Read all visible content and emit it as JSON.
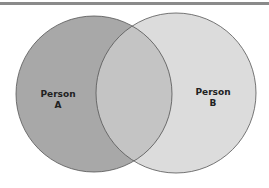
{
  "diagram": {
    "type": "venn",
    "sets": [
      {
        "id": "A",
        "label_line1": "Person",
        "label_line2": "A",
        "fill": "#a8a8a8"
      },
      {
        "id": "B",
        "label_line1": "Person",
        "label_line2": "B",
        "fill": "#dcdcdc"
      }
    ],
    "overlap_fill": "#c4c4c4",
    "stroke": "#555555"
  }
}
